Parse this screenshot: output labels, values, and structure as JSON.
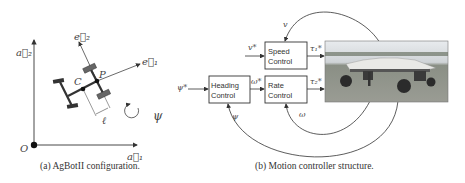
{
  "figure": {
    "panel_a": {
      "caption": "(a) AgBotII configuration.",
      "labels": {
        "a1": "a⃗₁",
        "a2": "a⃗₂",
        "e1": "e⃗₁",
        "e2": "e⃗₂",
        "origin": "O",
        "center": "C",
        "point": "P",
        "offset": "ℓ",
        "heading": "ψ"
      }
    },
    "panel_b": {
      "caption": "(b) Motion controller structure.",
      "blocks": {
        "speed": [
          "Speed",
          "Control"
        ],
        "heading": [
          "Heading",
          "Control"
        ],
        "rate": [
          "Rate",
          "Control"
        ]
      },
      "signals": {
        "v_ref": "v*",
        "psi_ref": "ψ*",
        "omega_ref": "ω*",
        "tau1": "τ₁*",
        "tau2": "τ₂*",
        "v_fb": "v",
        "omega_fb": "ω",
        "psi_fb": "ψ"
      },
      "image_alt": "AgBotII robot photo"
    }
  }
}
